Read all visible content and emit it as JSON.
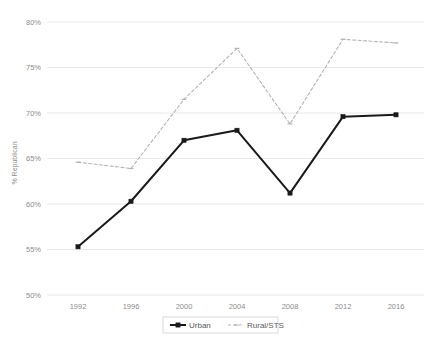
{
  "chart_data": {
    "type": "line",
    "title": "",
    "subtitle": "",
    "xlabel": "",
    "ylabel": "% Republican",
    "x": [
      1992,
      1996,
      2000,
      2004,
      2008,
      2012,
      2016
    ],
    "xtick_labels": [
      "1992",
      "1996",
      "2000",
      "2004",
      "2008",
      "2012",
      "2016"
    ],
    "ytick_labels": [
      "50%",
      "55%",
      "60%",
      "65%",
      "70%",
      "75%",
      "80%"
    ],
    "ytick_values": [
      50,
      55,
      60,
      65,
      70,
      75,
      80
    ],
    "ylim": [
      50,
      80
    ],
    "grid": "horizontal",
    "legend_position": "bottom",
    "series": [
      {
        "name": "Urban",
        "values": [
          55.3,
          60.3,
          67.0,
          68.1,
          61.2,
          69.6,
          69.8
        ],
        "color": "#1a1a1a",
        "style": "solid",
        "marker": "square"
      },
      {
        "name": "Rural/STS",
        "values": [
          64.6,
          63.9,
          71.5,
          77.1,
          68.8,
          78.1,
          77.7
        ],
        "color": "#b3b3b3",
        "style": "dashed",
        "marker": "dash"
      }
    ],
    "annotations": []
  },
  "legend": {
    "items": [
      {
        "label": "Urban"
      },
      {
        "label": "Rural/STS"
      }
    ]
  },
  "colors": {
    "urban": "#1a1a1a",
    "rural": "#b3b3b3",
    "gridline": "#e8e8e8",
    "tick_text": "#8c8c8c",
    "legend_border": "#d0d0d0",
    "background": "#ffffff"
  }
}
